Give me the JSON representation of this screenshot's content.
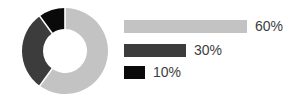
{
  "chart_data": {
    "type": "pie",
    "variant": "donut",
    "title": "",
    "subtitle": "",
    "xlabel": "",
    "ylabel": "",
    "grid": false,
    "legend_position": "right",
    "legend_style": "proportional-bars",
    "start_angle_deg": 0,
    "direction": "clockwise",
    "inner_radius_ratio": 0.51,
    "categories": [
      "60%",
      "30%",
      "10%"
    ],
    "values": [
      60,
      30,
      10
    ],
    "labels": [
      "60%",
      "30%",
      "10%"
    ],
    "colors": [
      "#c3c3c3",
      "#3c3c3c",
      "#0a0a0a"
    ],
    "separator_color": "#ffffff",
    "background": "#ffffff",
    "text_color": "#3d3d3d",
    "slices": [
      {
        "label": "60%",
        "value": 60,
        "color": "#c3c3c3",
        "start_deg": 0,
        "end_deg": 216,
        "bar_width_px": 123
      },
      {
        "label": "30%",
        "value": 30,
        "color": "#3c3c3c",
        "start_deg": 216,
        "end_deg": 324,
        "bar_width_px": 62
      },
      {
        "label": "10%",
        "value": 10,
        "color": "#0a0a0a",
        "start_deg": 324,
        "end_deg": 360,
        "bar_width_px": 21
      }
    ]
  },
  "donut": {
    "center_x": 44,
    "center_y": 44,
    "outer_radius": 43,
    "inner_radius": 22,
    "stroke_width": 21,
    "separator_width": 1.6
  }
}
